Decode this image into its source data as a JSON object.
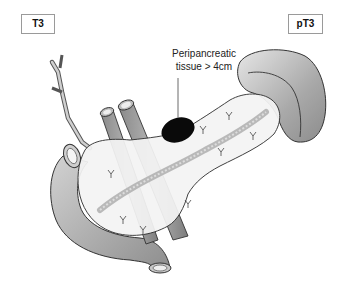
{
  "labels": {
    "clinical_stage": "T3",
    "pathologic_stage": "pT3"
  },
  "annotation": {
    "line1": "Peripancreatic",
    "line2": "tissue > 4cm"
  },
  "colors": {
    "tumor": "#0a0a0a",
    "organ_fill": "#f2f2f2",
    "vessel_fill": "#9a9a9a",
    "duodenum_fill": "#b8b8b8",
    "spleen_fill": "#a8a8a8",
    "outline": "#333333"
  },
  "structures": [
    "pancreas",
    "duodenum",
    "spleen",
    "bile duct",
    "portal vein",
    "aorta",
    "pancreatic duct",
    "tumor"
  ]
}
